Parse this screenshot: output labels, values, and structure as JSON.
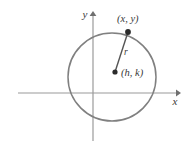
{
  "figure": {
    "background_color": "#ffffff",
    "axes": {
      "x_label": "x",
      "y_label": "y",
      "axis_color": "#9a9a9a",
      "arrow_color": "#6f6f6f",
      "x_axis_y": 93,
      "x_axis_start": 18,
      "x_axis_end": 178,
      "y_axis_x": 93,
      "y_axis_start": 14,
      "y_axis_end": 141
    },
    "circle": {
      "center_x": 112,
      "center_y": 77,
      "radius": 44,
      "stroke_color": "#808080",
      "stroke_width": 1.4,
      "fill": "none"
    },
    "center_point": {
      "label": "(h, k)",
      "x": 115,
      "y": 72,
      "marker_color": "#2b2b2b",
      "marker_radius": 2.6,
      "label_x": 121,
      "label_y": 76
    },
    "circle_point": {
      "label": "(x, y)",
      "x": 128,
      "y": 32,
      "marker_color": "#2b2b2b",
      "marker_radius": 2.8,
      "label_x": 117,
      "label_y": 22
    },
    "radius_segment": {
      "label": "r",
      "stroke_color": "#555555",
      "stroke_width": 1.3,
      "label_x": 124,
      "label_y": 54
    }
  }
}
